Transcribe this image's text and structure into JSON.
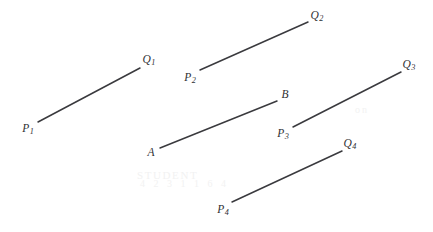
{
  "figure": {
    "width": 433,
    "height": 232,
    "background_color": "#ffffff",
    "line_color": "#3a3a3e",
    "label_color": "#2f2f33",
    "line_width": 1.5
  },
  "segments": [
    {
      "id": "segment-p1-q1",
      "start": {
        "label_base": "P",
        "label_sub": "1",
        "x": 38,
        "y": 122,
        "label_x": 28,
        "label_y": 130
      },
      "end": {
        "label_base": "Q",
        "label_sub": "1",
        "x": 140,
        "y": 68,
        "label_x": 149,
        "label_y": 61
      }
    },
    {
      "id": "segment-p2-q2",
      "start": {
        "label_base": "P",
        "label_sub": "2",
        "x": 200,
        "y": 70,
        "label_x": 190,
        "label_y": 79
      },
      "end": {
        "label_base": "Q",
        "label_sub": "2",
        "x": 308,
        "y": 22,
        "label_x": 317,
        "label_y": 17
      }
    },
    {
      "id": "segment-a-b",
      "start": {
        "label_base": "A",
        "label_sub": "",
        "x": 160,
        "y": 148,
        "label_x": 151,
        "label_y": 153
      },
      "end": {
        "label_base": "B",
        "label_sub": "",
        "x": 277,
        "y": 101,
        "label_x": 285,
        "label_y": 95
      }
    },
    {
      "id": "segment-p3-q3",
      "start": {
        "label_base": "P",
        "label_sub": "3",
        "x": 293,
        "y": 127,
        "label_x": 283,
        "label_y": 135
      },
      "end": {
        "label_base": "Q",
        "label_sub": "3",
        "x": 401,
        "y": 72,
        "label_x": 409,
        "label_y": 66
      }
    },
    {
      "id": "segment-p4-q4",
      "start": {
        "label_base": "P",
        "label_sub": "4",
        "x": 232,
        "y": 202,
        "label_x": 223,
        "label_y": 211
      },
      "end": {
        "label_base": "Q",
        "label_sub": "4",
        "x": 342,
        "y": 151,
        "label_x": 350,
        "label_y": 145
      }
    }
  ],
  "watermark": {
    "upper_text": "STUDENT",
    "lower_text": "4 2 3 1 1 6 4",
    "right_text": "on"
  }
}
